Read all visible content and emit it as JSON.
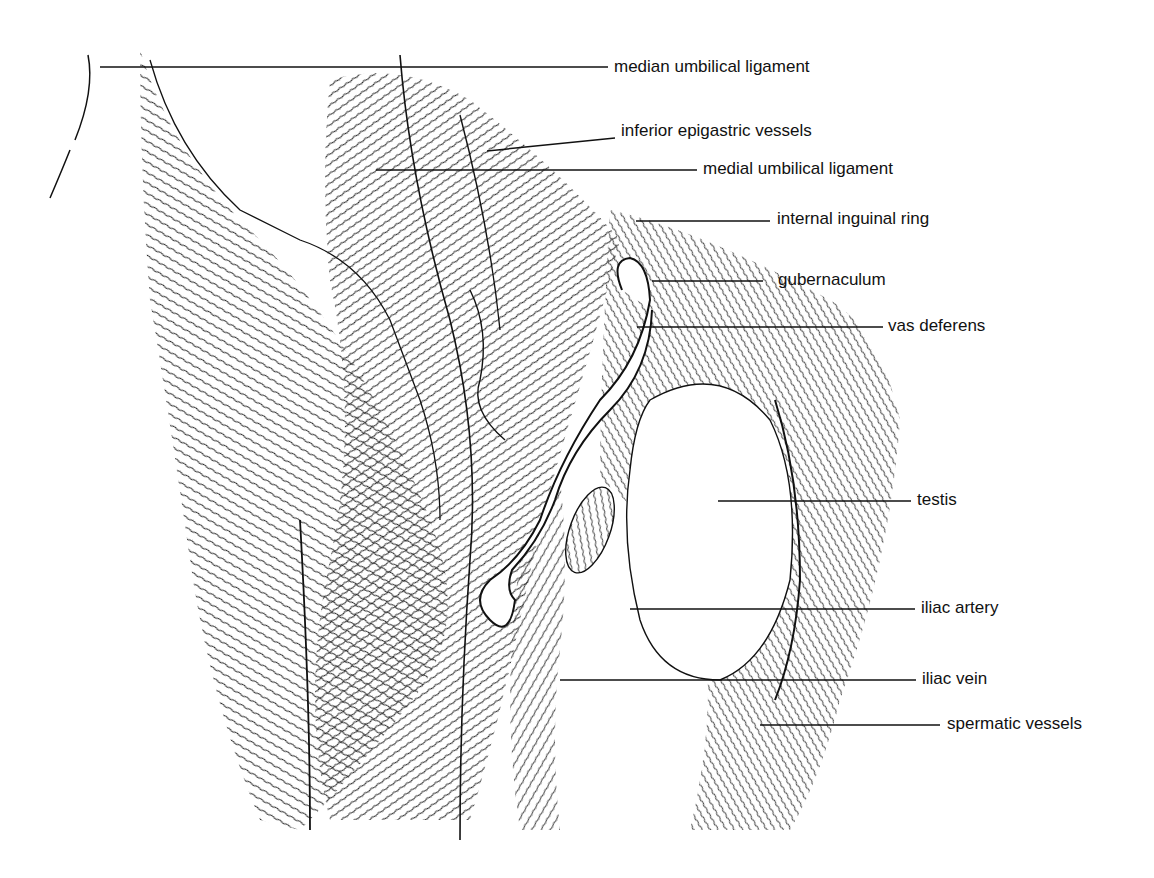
{
  "figure": {
    "labels": [
      {
        "id": "median-umbilical-ligament",
        "text": "median umbilical ligament",
        "x": 614,
        "y": 57,
        "line": [
          100,
          67,
          608,
          67
        ]
      },
      {
        "id": "inferior-epigastric-vessels",
        "text": "inferior epigastric vessels",
        "x": 621,
        "y": 121,
        "line": [
          487,
          151,
          615,
          138
        ]
      },
      {
        "id": "medial-umbilical-ligament",
        "text": "medial umbilical ligament",
        "x": 703,
        "y": 159,
        "line": [
          376,
          170,
          697,
          170
        ]
      },
      {
        "id": "internal-inguinal-ring",
        "text": "internal inguinal ring",
        "x": 777,
        "y": 209,
        "line": [
          636,
          221,
          770,
          221
        ]
      },
      {
        "id": "gubernaculum",
        "text": "gubernaculum",
        "x": 778,
        "y": 270,
        "line": [
          652,
          281,
          763,
          281
        ]
      },
      {
        "id": "vas-deferens",
        "text": "vas deferens",
        "x": 888,
        "y": 316,
        "line": [
          637,
          327,
          883,
          327
        ]
      },
      {
        "id": "testis",
        "text": "testis",
        "x": 917,
        "y": 490,
        "line": [
          718,
          501,
          911,
          501
        ]
      },
      {
        "id": "iliac-artery",
        "text": "iliac artery",
        "x": 921,
        "y": 598,
        "line": [
          630,
          609,
          915,
          609
        ]
      },
      {
        "id": "iliac-vein",
        "text": "iliac vein",
        "x": 922,
        "y": 669,
        "line": [
          560,
          680,
          916,
          680
        ]
      },
      {
        "id": "spermatic-vessels",
        "text": "spermatic vessels",
        "x": 947,
        "y": 714,
        "line": [
          760,
          725,
          940,
          725
        ]
      }
    ]
  }
}
